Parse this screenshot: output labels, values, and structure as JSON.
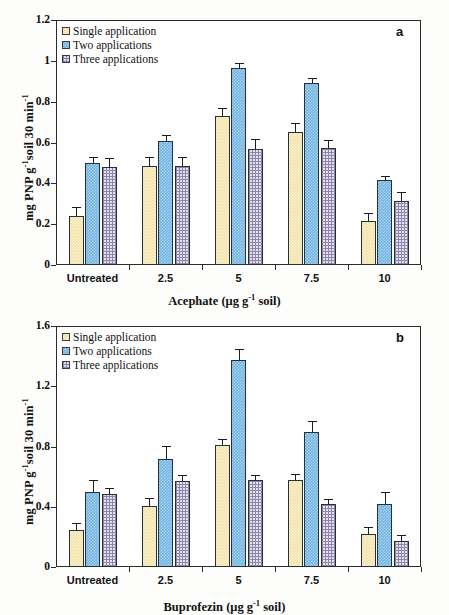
{
  "figure": {
    "legend_labels": [
      "Single application",
      "Two applications",
      "Three applications"
    ],
    "colors": {
      "single": "#f3e1a2",
      "two": "#72b4e2",
      "three": "#e6e1ee",
      "outline": "#23313d",
      "axis": "#2b2b2b"
    }
  },
  "panel_a": {
    "label": "a",
    "ylabel_main": "mg PNP g",
    "ylabel_sup1": "-1",
    "ylabel_mid": "soil 30 min",
    "ylabel_sup2": "-1",
    "xlabel_main": "Acephate (μg g",
    "xlabel_sup": "-1",
    "xlabel_tail": " soil)",
    "ytick_labels": [
      "1.2",
      "1",
      "0.8",
      "0.6",
      "0.4",
      "0.2",
      "0"
    ],
    "xtick_labels": [
      "Untreated",
      "2.5",
      "5",
      "7.5",
      "10"
    ]
  },
  "panel_b": {
    "label": "b",
    "ylabel_main": "mg PNP g",
    "ylabel_sup1": "-1",
    "ylabel_mid": "soil 30 min",
    "ylabel_sup2": "-1",
    "xlabel_main": "Buprofezin (μg g",
    "xlabel_sup": "-1",
    "xlabel_tail": " soil)",
    "ytick_labels": [
      "1.6",
      "1.2",
      "0.8",
      "0.4",
      "0"
    ],
    "xtick_labels": [
      "Untreated",
      "2.5",
      "5",
      "7.5",
      "10"
    ]
  },
  "chart_data": [
    {
      "type": "bar",
      "title": "a",
      "xlabel": "Acephate (μg g-1 soil)",
      "ylabel": "mg PNP g-1 soil 30 min-1",
      "categories": [
        "Untreated",
        "2.5",
        "5",
        "7.5",
        "10"
      ],
      "ylim": [
        0,
        1.2
      ],
      "yticks": [
        0,
        0.2,
        0.4,
        0.6,
        0.8,
        1.0,
        1.2
      ],
      "grid": false,
      "legend_position": "top-left",
      "series": [
        {
          "name": "Single application",
          "values": [
            0.24,
            0.485,
            0.73,
            0.65,
            0.215
          ],
          "errors": [
            0.045,
            0.045,
            0.04,
            0.045,
            0.04
          ]
        },
        {
          "name": "Two applications",
          "values": [
            0.5,
            0.605,
            0.965,
            0.89,
            0.415
          ],
          "errors": [
            0.03,
            0.03,
            0.025,
            0.025,
            0.02
          ]
        },
        {
          "name": "Three applications",
          "values": [
            0.48,
            0.485,
            0.57,
            0.575,
            0.315
          ],
          "errors": [
            0.045,
            0.045,
            0.045,
            0.035,
            0.045
          ]
        }
      ]
    },
    {
      "type": "bar",
      "title": "b",
      "xlabel": "Buprofezin (μg g-1 soil)",
      "ylabel": "mg PNP g-1 soil 30 min-1",
      "categories": [
        "Untreated",
        "2.5",
        "5",
        "7.5",
        "10"
      ],
      "ylim": [
        0,
        1.6
      ],
      "yticks": [
        0,
        0.4,
        0.8,
        1.2,
        1.6
      ],
      "grid": false,
      "legend_position": "top-left",
      "series": [
        {
          "name": "Single application",
          "values": [
            0.245,
            0.405,
            0.81,
            0.575,
            0.22
          ],
          "errors": [
            0.05,
            0.055,
            0.04,
            0.04,
            0.045
          ]
        },
        {
          "name": "Two applications",
          "values": [
            0.5,
            0.72,
            1.375,
            0.895,
            0.415
          ],
          "errors": [
            0.075,
            0.085,
            0.07,
            0.075,
            0.08
          ]
        },
        {
          "name": "Three applications",
          "values": [
            0.485,
            0.57,
            0.575,
            0.415,
            0.175
          ],
          "errors": [
            0.04,
            0.04,
            0.035,
            0.035,
            0.035
          ]
        }
      ]
    }
  ]
}
